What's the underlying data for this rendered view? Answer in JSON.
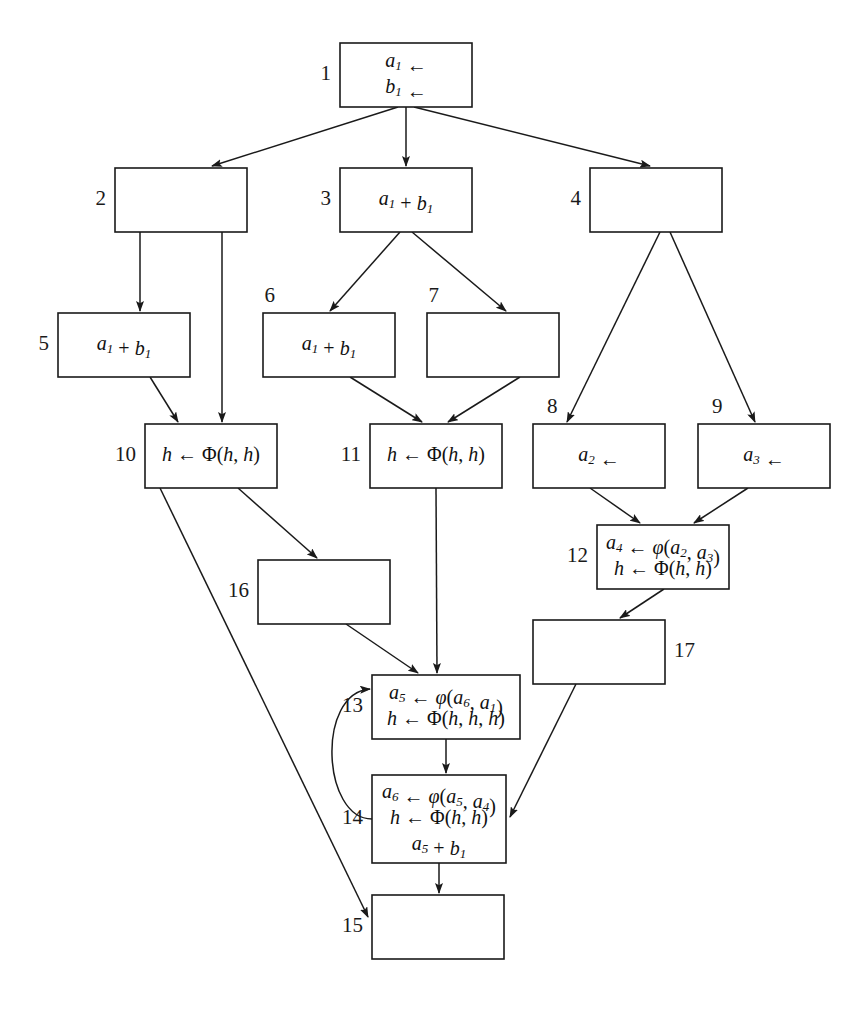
{
  "diagram": {
    "background_color": "#ffffff",
    "line_color": "#1a1a1a"
  },
  "nodes": [
    {
      "id": "1",
      "label": "1",
      "label_side": "left",
      "x": 340,
      "y": 43,
      "w": 132,
      "h": 64,
      "lines": [
        "a1 ←",
        "b1 ←"
      ]
    },
    {
      "id": "2",
      "label": "2",
      "label_side": "left",
      "x": 115,
      "y": 168,
      "w": 132,
      "h": 64,
      "lines": []
    },
    {
      "id": "3",
      "label": "3",
      "label_side": "left",
      "x": 340,
      "y": 168,
      "w": 132,
      "h": 64,
      "lines": [
        "a1 + b1"
      ]
    },
    {
      "id": "4",
      "label": "4",
      "label_side": "left",
      "x": 590,
      "y": 168,
      "w": 132,
      "h": 64,
      "lines": []
    },
    {
      "id": "5",
      "label": "5",
      "label_side": "left",
      "x": 58,
      "y": 313,
      "w": 132,
      "h": 64,
      "lines": [
        "a1 + b1"
      ]
    },
    {
      "id": "6",
      "label": "6",
      "label_side": "top-left",
      "x": 263,
      "y": 313,
      "w": 132,
      "h": 64,
      "lines": [
        "a1 + b1"
      ]
    },
    {
      "id": "7",
      "label": "7",
      "label_side": "top-left",
      "x": 427,
      "y": 313,
      "w": 132,
      "h": 64,
      "lines": []
    },
    {
      "id": "8",
      "label": "8",
      "label_side": "top-right",
      "x": 533,
      "y": 424,
      "w": 132,
      "h": 64,
      "lines": [
        "a2 ←"
      ]
    },
    {
      "id": "9",
      "label": "9",
      "label_side": "top-right",
      "x": 698,
      "y": 424,
      "w": 132,
      "h": 64,
      "lines": [
        "a3 ←"
      ]
    },
    {
      "id": "10",
      "label": "10",
      "label_side": "left",
      "x": 145,
      "y": 424,
      "w": 132,
      "h": 64,
      "lines": [
        "h ← Φ(h, h)"
      ]
    },
    {
      "id": "11",
      "label": "11",
      "label_side": "left",
      "x": 370,
      "y": 424,
      "w": 132,
      "h": 64,
      "lines": [
        "h ← Φ(h, h)"
      ]
    },
    {
      "id": "12",
      "label": "12",
      "label_side": "left",
      "x": 597,
      "y": 525,
      "w": 132,
      "h": 64,
      "lines": [
        "a4 ← φ(a2, a3)",
        "h ← Φ(h, h)"
      ]
    },
    {
      "id": "13",
      "label": "13",
      "label_side": "left",
      "x": 372,
      "y": 675,
      "w": 148,
      "h": 64,
      "lines": [
        "a5 ← φ(a6, a1)",
        "h ← Φ(h, h, h)"
      ]
    },
    {
      "id": "14",
      "label": "14",
      "label_side": "left",
      "x": 372,
      "y": 775,
      "w": 134,
      "h": 88,
      "lines": [
        "a6 ← φ(a5, a4)",
        "h ← Φ(h, h)",
        "a5 + b1"
      ]
    },
    {
      "id": "15",
      "label": "15",
      "label_side": "left",
      "x": 372,
      "y": 895,
      "w": 132,
      "h": 64,
      "lines": []
    },
    {
      "id": "16",
      "label": "16",
      "label_side": "left",
      "x": 258,
      "y": 560,
      "w": 132,
      "h": 64,
      "lines": []
    },
    {
      "id": "17",
      "label": "17",
      "label_side": "right",
      "x": 533,
      "y": 620,
      "w": 132,
      "h": 64,
      "lines": []
    }
  ],
  "edges": [
    {
      "from": "1",
      "to": "2",
      "kind": "straight"
    },
    {
      "from": "1",
      "to": "3",
      "kind": "straight"
    },
    {
      "from": "1",
      "to": "4",
      "kind": "straight"
    },
    {
      "from": "2",
      "to": "5",
      "kind": "straight"
    },
    {
      "from": "2",
      "to": "10",
      "kind": "straight"
    },
    {
      "from": "3",
      "to": "6",
      "kind": "straight"
    },
    {
      "from": "3",
      "to": "7",
      "kind": "straight"
    },
    {
      "from": "4",
      "to": "8",
      "kind": "straight"
    },
    {
      "from": "4",
      "to": "9",
      "kind": "straight"
    },
    {
      "from": "5",
      "to": "10",
      "kind": "straight"
    },
    {
      "from": "6",
      "to": "11",
      "kind": "straight"
    },
    {
      "from": "7",
      "to": "11",
      "kind": "straight"
    },
    {
      "from": "8",
      "to": "12",
      "kind": "straight"
    },
    {
      "from": "9",
      "to": "12",
      "kind": "straight"
    },
    {
      "from": "10",
      "to": "16",
      "kind": "straight"
    },
    {
      "from": "10",
      "to": "15",
      "kind": "straight"
    },
    {
      "from": "11",
      "to": "13",
      "kind": "straight"
    },
    {
      "from": "12",
      "to": "17",
      "kind": "straight"
    },
    {
      "from": "16",
      "to": "13",
      "kind": "straight"
    },
    {
      "from": "17",
      "to": "14",
      "kind": "straight"
    },
    {
      "from": "13",
      "to": "14",
      "kind": "straight"
    },
    {
      "from": "14",
      "to": "13",
      "kind": "back-edge-curve"
    },
    {
      "from": "14",
      "to": "15",
      "kind": "straight"
    }
  ]
}
